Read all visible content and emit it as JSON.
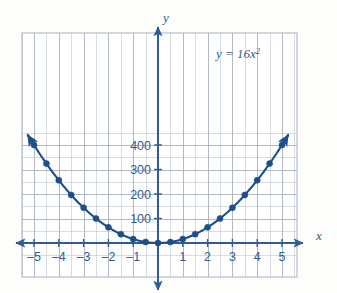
{
  "figure": {
    "background_color": "#fdfdfb",
    "curve_color": "#1d4e89",
    "grid_color": "#b9bfca",
    "grid_minor_color": "#cfd4dc",
    "axis_color": "#2f5b96",
    "label_color": "#2f5b96",
    "frame": {
      "left_px": 22,
      "right_px": 297,
      "top_px": 33,
      "bottom_px": 277,
      "origin_x_px": 158,
      "origin_y_px": 243,
      "px_per_x_unit": 24.8,
      "px_per_100_y": 24.5
    },
    "axis_label_x": "x",
    "axis_label_y": "y",
    "equation_label": "y = 16x",
    "equation_exponent": "2",
    "bleed_text_a": "",
    "bleed_text_b": "",
    "bleed_text_c": ""
  },
  "chart_data": {
    "type": "line",
    "title": "",
    "subtitle": "",
    "xlabel": "x",
    "ylabel": "y",
    "equation": "y = 16x^2",
    "legend": [],
    "legend_position": "none",
    "annotations": [
      {
        "text": "y = 16x²",
        "x": 3.0,
        "y": 390
      }
    ],
    "grid": true,
    "grid_x_step": 0.5,
    "grid_y_step": 50,
    "xlim": [
      -5.5,
      5.5
    ],
    "ylim": [
      -70,
      450
    ],
    "xticks": [
      -5,
      -4,
      -3,
      -2,
      -1,
      1,
      2,
      3,
      4,
      5
    ],
    "xticklabels": [
      "–5",
      "–4",
      "–3",
      "–2",
      "–1",
      "1",
      "2",
      "3",
      "4",
      "5"
    ],
    "yticks": [
      100,
      200,
      300,
      400
    ],
    "yticklabels": [
      "100",
      "200",
      "300",
      "400"
    ],
    "marker_style": "filled-circle",
    "marker_color": "#1d4e89",
    "line_color": "#1d4e89",
    "line_width_px": 2.0,
    "x": [
      -5,
      -4.5,
      -4,
      -3.5,
      -3,
      -2.5,
      -2,
      -1.5,
      -1,
      -0.5,
      0,
      0.5,
      1,
      1.5,
      2,
      2.5,
      3,
      3.5,
      4,
      4.5,
      5
    ],
    "values": [
      400,
      324,
      256,
      196,
      144,
      100,
      64,
      36,
      16,
      4,
      0,
      4,
      16,
      36,
      64,
      100,
      144,
      196,
      256,
      324,
      400
    ],
    "series": [
      {
        "name": "y = 16x^2",
        "x": [
          -5,
          -4.5,
          -4,
          -3.5,
          -3,
          -2.5,
          -2,
          -1.5,
          -1,
          -0.5,
          0,
          0.5,
          1,
          1.5,
          2,
          2.5,
          3,
          3.5,
          4,
          4.5,
          5
        ],
        "values": [
          400,
          324,
          256,
          196,
          144,
          100,
          64,
          36,
          16,
          4,
          0,
          4,
          16,
          36,
          64,
          100,
          144,
          196,
          256,
          324,
          400
        ]
      }
    ],
    "curve_extends_beyond_markers": true,
    "curve_x_range": [
      -5.25,
      5.25
    ],
    "arrowheads": [
      "curve-left-end",
      "curve-right-end",
      "x-axis-left",
      "x-axis-right",
      "y-axis-top",
      "y-axis-bottom"
    ]
  }
}
